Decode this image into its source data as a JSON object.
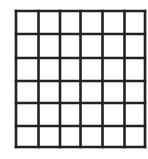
{
  "diagram": {
    "type": "grid",
    "rows": 6,
    "columns": 6,
    "line_color": "#222222",
    "background": "#ffffff",
    "x_lines": [
      16,
      38.5,
      60,
      80.5,
      102.5,
      124.5,
      145
    ],
    "y_lines": [
      11,
      34,
      58,
      81,
      103,
      126,
      147
    ],
    "stroke_width": 2.6
  }
}
